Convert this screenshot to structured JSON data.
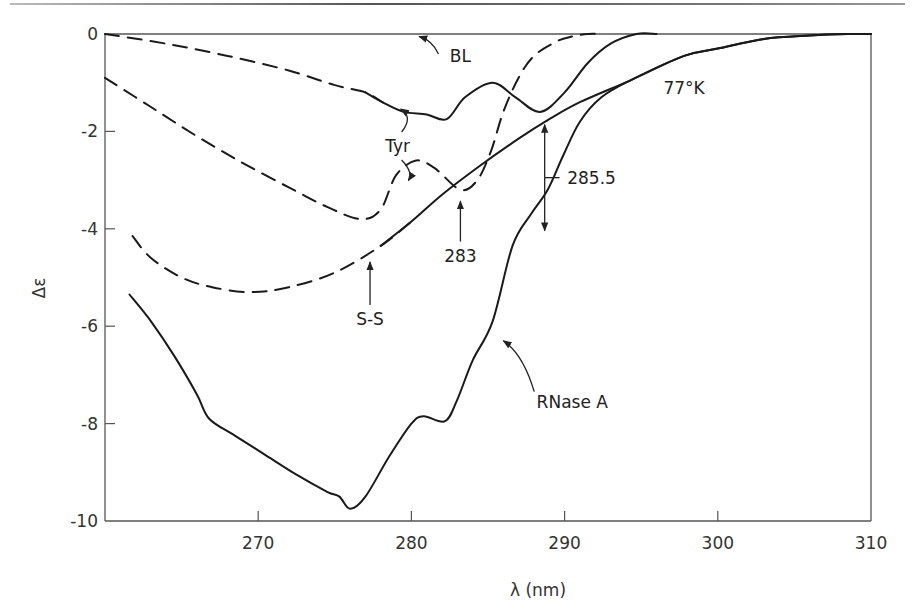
{
  "chart_data": {
    "type": "line",
    "title": "",
    "xlabel": "λ (nm)",
    "ylabel": "Δε",
    "xlim": [
      260,
      310
    ],
    "ylim": [
      -10,
      0
    ],
    "grid": false,
    "legend": "none",
    "x_ticks": [
      270,
      280,
      290,
      300,
      310
    ],
    "y_ticks": [
      0,
      -2,
      -4,
      -6,
      -8,
      -10
    ],
    "x_tick_labels": [
      "270",
      "280",
      "290",
      "300",
      "310"
    ],
    "y_tick_labels": [
      "0",
      "-2",
      "-4",
      "-6",
      "-8",
      "-10"
    ],
    "series": [
      {
        "name": "BL",
        "style": "solid",
        "x": [
          260,
          310
        ],
        "y": [
          0,
          0
        ]
      },
      {
        "name": "Tyr (upper)",
        "style": "dashed-then-solid",
        "dash_until": 277.5,
        "x": [
          260,
          264,
          268,
          272,
          275,
          277,
          278.1,
          279.5,
          281,
          282.3,
          283.5,
          285.3,
          286.8,
          288.4,
          290,
          291.5,
          293,
          294.7,
          296
        ],
        "y": [
          0,
          -0.2,
          -0.45,
          -0.75,
          -1.05,
          -1.2,
          -1.4,
          -1.6,
          -1.65,
          -1.75,
          -1.3,
          -1.0,
          -1.3,
          -1.6,
          -1.2,
          -0.6,
          -0.2,
          0,
          0
        ]
      },
      {
        "name": "Tyr (lower)",
        "style": "dashed",
        "x": [
          260,
          263,
          266,
          269,
          272,
          274.5,
          276.7,
          278,
          279,
          280.3,
          281.5,
          283.2,
          284.3,
          285.2,
          286,
          287,
          288,
          289.5,
          290.5,
          291.5,
          292.5
        ],
        "y": [
          -0.9,
          -1.5,
          -2.1,
          -2.65,
          -3.15,
          -3.55,
          -3.8,
          -3.6,
          -2.9,
          -2.6,
          -2.75,
          -3.2,
          -3.0,
          -2.4,
          -1.6,
          -0.9,
          -0.45,
          -0.15,
          -0.05,
          0,
          0
        ]
      },
      {
        "name": "S-S",
        "style": "dashed-then-solid",
        "dash_until": 278.5,
        "x": [
          261.8,
          263,
          265,
          267,
          269.5,
          272,
          275,
          278,
          280,
          282,
          284.5,
          287,
          289,
          291,
          294.3,
          297.8,
          300,
          303,
          306,
          308.5,
          310
        ],
        "y": [
          -4.15,
          -4.6,
          -5.0,
          -5.2,
          -5.3,
          -5.2,
          -4.9,
          -4.35,
          -3.85,
          -3.3,
          -2.7,
          -2.15,
          -1.75,
          -1.4,
          -0.95,
          -0.45,
          -0.3,
          -0.1,
          -0.03,
          0,
          0
        ]
      },
      {
        "name": "RNase A",
        "style": "solid",
        "x": [
          261.6,
          263,
          264.5,
          266,
          266.8,
          268.5,
          270.5,
          272.5,
          274.5,
          275.3,
          276,
          277,
          278.5,
          280,
          280.8,
          282.2,
          283,
          284,
          285.3,
          286.6,
          287.8,
          288.9,
          289.9,
          291,
          292.4,
          294.3,
          297.8,
          300,
          303,
          306,
          308.5,
          310
        ],
        "y": [
          -5.35,
          -5.9,
          -6.6,
          -7.4,
          -7.9,
          -8.25,
          -8.65,
          -9.05,
          -9.4,
          -9.5,
          -9.75,
          -9.5,
          -8.7,
          -8.0,
          -7.85,
          -7.95,
          -7.5,
          -6.7,
          -5.9,
          -4.35,
          -3.7,
          -3.2,
          -2.5,
          -1.8,
          -1.3,
          -0.95,
          -0.45,
          -0.3,
          -0.1,
          -0.03,
          0,
          0
        ]
      }
    ],
    "annotations": [
      {
        "text": "BL",
        "x": 283.2,
        "y": -0.45,
        "arrow_to": [
          280.5,
          -0.05
        ]
      },
      {
        "text": "Tyr",
        "x": 279.1,
        "y": -2.3,
        "arrows_to": [
          [
            279.5,
            -1.5
          ],
          [
            280.0,
            -3.05
          ]
        ]
      },
      {
        "text": "283",
        "x": 283.2,
        "y": -4.55,
        "arrow_to": [
          283.2,
          -3.35
        ]
      },
      {
        "text": "S-S",
        "x": 277.3,
        "y": -5.85,
        "arrow_to": [
          277.3,
          -4.6
        ]
      },
      {
        "text": "285.5",
        "x": 291.5,
        "y": -2.95,
        "double_arrow": [
          [
            288.7,
            -1.8
          ],
          [
            288.7,
            -4.1
          ]
        ]
      },
      {
        "text": "77°K",
        "x": 297.8,
        "y": -1.1
      },
      {
        "text": "RNase A",
        "x": 290.5,
        "y": -7.55,
        "arrow_to": [
          286.0,
          -6.3
        ]
      }
    ]
  }
}
